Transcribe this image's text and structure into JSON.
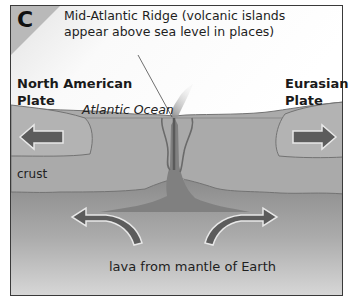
{
  "panel": {
    "letter": "C"
  },
  "labels": {
    "ridge_line1": "Mid-Atlantic Ridge (volcanic islands",
    "ridge_line2": "appear above sea level in places)",
    "north_american_line1": "North American",
    "north_american_line2": "Plate",
    "eurasian_line1": "Eurasian",
    "eurasian_line2": "Plate",
    "ocean": "Atlantic Ocean",
    "crust": "crust",
    "lava": "lava from mantle of Earth"
  },
  "colors": {
    "frame_border": "#3a3a3a",
    "sky": "#ffffff",
    "corner_tab": "#b9b9b9",
    "crust": "#a9a9a9",
    "crust_outline": "#6e6e6e",
    "mantle_top": "#8f8f8f",
    "mantle_bottom": "#d4d4d4",
    "magma": "#7f7f7f",
    "arrow_fill": "#5c5c5c",
    "arrow_outline": "#e6e6e6",
    "steam": "#9a9a9a"
  },
  "arrows": [
    {
      "name": "north-american-plate-arrow",
      "direction": "left"
    },
    {
      "name": "eurasian-plate-arrow",
      "direction": "right"
    },
    {
      "name": "mantle-convection-arrow-left",
      "direction": "up-left"
    },
    {
      "name": "mantle-convection-arrow-right",
      "direction": "up-right"
    }
  ]
}
